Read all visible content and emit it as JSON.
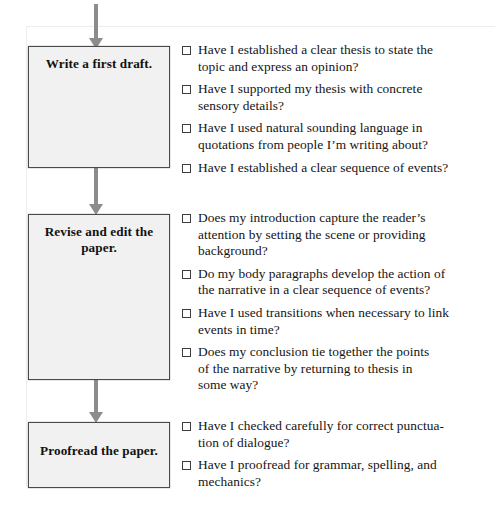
{
  "diagram": {
    "colors": {
      "box_fill": "#f1f1f1",
      "box_border": "#4a4a4a",
      "arrow": "#8c8c8c",
      "text": "#141414",
      "page_background": "#ffffff"
    },
    "stages": [
      {
        "id": "write-first-draft",
        "label": "Write a first draft.",
        "checklist": [
          "Have I established a clear thesis to state the\ntopic and express an opinion?",
          "Have I supported my thesis with concrete\nsensory details?",
          "Have I used natural sounding language in\nquotations from people I’m writing about?",
          "Have I established a clear sequence of events?"
        ]
      },
      {
        "id": "revise-and-edit",
        "label": "Revise and edit the paper.",
        "checklist": [
          "Does my introduction capture the reader’s\nattention by setting the scene or providing\nbackground?",
          "Do my body paragraphs develop the action of\nthe narrative in a clear sequence of events?",
          "Have I used transitions when necessary to link\nevents in time?",
          "Does my conclusion tie together the points\nof the narrative by returning to thesis in\nsome way?"
        ]
      },
      {
        "id": "proofread",
        "label": "Proofread the paper.",
        "checklist": [
          "Have I checked carefully for correct punctua-\ntion of dialogue?",
          "Have I proofread for grammar, spelling, and\nmechanics?"
        ]
      }
    ],
    "connectors": [
      {
        "id": "arrow-into-write-first-draft",
        "icon": "down-arrow-icon"
      },
      {
        "id": "arrow-write-to-revise",
        "icon": "down-arrow-icon"
      },
      {
        "id": "arrow-revise-to-proofread",
        "icon": "down-arrow-icon"
      }
    ]
  }
}
